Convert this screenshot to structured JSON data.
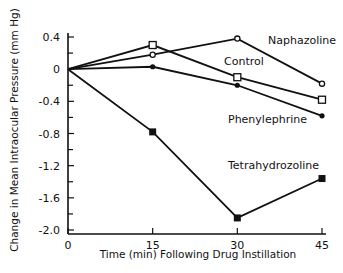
{
  "chart_data": {
    "type": "line",
    "title": "",
    "xlabel": "Time (min) Following Drug Instillation",
    "ylabel": "Change in Mean Intraocular Pressure (mm Hg)",
    "x": [
      0,
      15,
      30,
      45
    ],
    "xticks": [
      0,
      15,
      30,
      45
    ],
    "xtick_labels": [
      "0",
      "15",
      "30",
      "45"
    ],
    "xlim": [
      0,
      45
    ],
    "yticks": [
      0.4,
      0,
      -0.4,
      -0.8,
      -1.2,
      -1.6,
      -2.0
    ],
    "ytick_labels": [
      "0.4",
      "0",
      "-0.4",
      "-0.8",
      "-1.2",
      "-1.6",
      "-2.0"
    ],
    "ylim": [
      -2.0,
      0.4
    ],
    "grid": false,
    "legend": "inline labels",
    "series": [
      {
        "name": "Naphazoline",
        "marker": "open-circle",
        "values": [
          0,
          0.18,
          0.38,
          -0.18
        ]
      },
      {
        "name": "Control",
        "marker": "open-square",
        "values": [
          0,
          0.3,
          -0.1,
          -0.38
        ]
      },
      {
        "name": "Phenylephrine",
        "marker": "filled-circle",
        "values": [
          0,
          0.03,
          -0.2,
          -0.58
        ]
      },
      {
        "name": "Tetrahydrozoline",
        "marker": "filled-square",
        "values": [
          0,
          -0.78,
          -1.85,
          -1.36
        ]
      }
    ]
  }
}
